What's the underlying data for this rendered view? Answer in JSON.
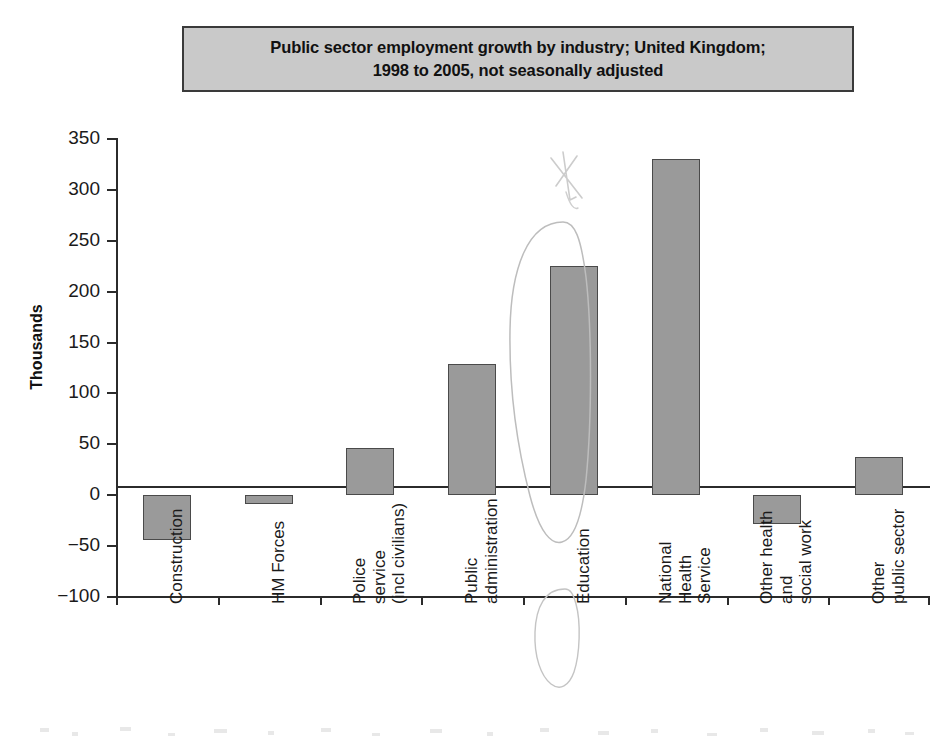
{
  "chart_data": {
    "type": "bar",
    "title": "Public sector employment growth by industry; United Kingdom;\n1998 to 2005, not seasonally adjusted",
    "xlabel": "",
    "ylabel": "Thousands",
    "ylim": [
      -100,
      350
    ],
    "ytick_labels": [
      "350",
      "300",
      "250",
      "200",
      "150",
      "100",
      "50",
      "0",
      "−50",
      "−100"
    ],
    "ytick_values": [
      350,
      300,
      250,
      200,
      150,
      100,
      50,
      0,
      -50,
      -100
    ],
    "grid": false,
    "legend": "none",
    "categories": [
      "Construction",
      "HM Forces",
      "Police\nservice\n(incl civilians)",
      "Public\nadministration",
      "Education",
      "National\nHealth\nService",
      "Other health\nand\nsocial work",
      "Other\npublic sector"
    ],
    "values": [
      -44,
      -9,
      46,
      129,
      225,
      330,
      -28,
      38
    ],
    "bar_color": "#9a9a9a",
    "bar_edge_color": "#4a4a4a",
    "annotations": [
      {
        "name": "education-circle",
        "type": "hand-drawn-ellipse",
        "target": "Education",
        "description": "Faint pencil ellipse drawn around the Education bar and its axis label"
      },
      {
        "name": "education-arrow-mark",
        "type": "hand-drawn-mark",
        "target": "Education",
        "description": "Faint pencil arrow/asterisk mark above the Education bar"
      }
    ]
  },
  "figure": {
    "title_box_fill": "#c9c9c9",
    "title_box_border": "#3a3a3a",
    "background": "#ffffff",
    "axis_color": "#2b2b2b"
  }
}
